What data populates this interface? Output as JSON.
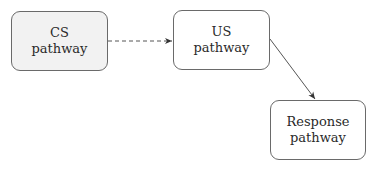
{
  "nodes": {
    "cs": {
      "line1": "CS",
      "line2": "pathway",
      "fill": "#f2f2f2"
    },
    "us": {
      "line1": "US",
      "line2": "pathway",
      "fill": "#ffffff"
    },
    "response": {
      "line1": "Response",
      "line2": "pathway",
      "fill": "#ffffff"
    }
  },
  "edges": [
    {
      "from": "CS pathway",
      "to": "US pathway",
      "style": "dashed"
    },
    {
      "from": "US pathway",
      "to": "Response pathway",
      "style": "solid"
    }
  ]
}
